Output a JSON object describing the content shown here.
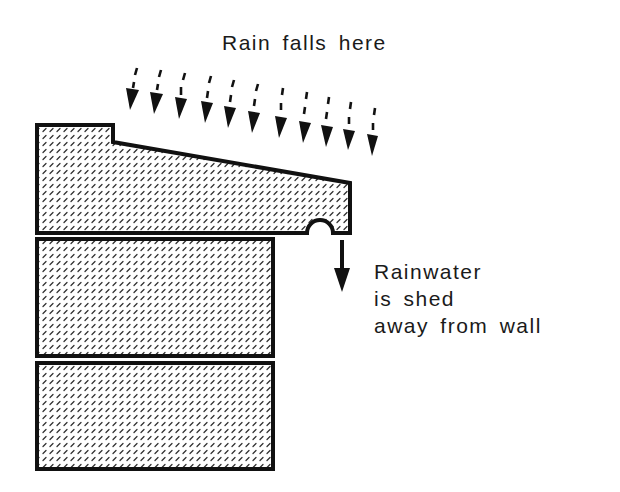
{
  "diagram": {
    "title": "Rain falls here",
    "side_label_lines": [
      "Rainwater",
      "is shed",
      "away from wall"
    ],
    "elements": {
      "coping_stone": "Sloped coping stone with drip groove underneath",
      "wall_blocks": 2,
      "rain_arrows": 11,
      "drip_arrow": "Downward arrow below drip groove"
    },
    "colors": {
      "stroke": "#111111",
      "hatch": "#333333",
      "background": "#ffffff"
    }
  }
}
